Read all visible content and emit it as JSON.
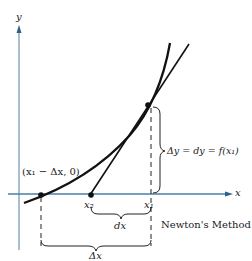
{
  "figure": {
    "caption": "Newton's Method",
    "axes": {
      "x_label": "x",
      "y_label": "y",
      "axis_color": "#4a7fa8"
    },
    "labels": {
      "crossing_point": "(x₁ − Δx, 0)",
      "x2": "x₂",
      "x1": "x₁",
      "dx": "dx",
      "delta_x": "Δx",
      "delta_y": "Δy = dy = f(x₁)"
    },
    "elements": {
      "curve": "y = f(x), convex increasing curve",
      "tangent_line": "tangent at (x1, f(x1)) meeting x-axis at x2",
      "points": [
        "(x1 - Δx, 0)",
        "x2",
        "(x1, f(x1))"
      ]
    }
  }
}
